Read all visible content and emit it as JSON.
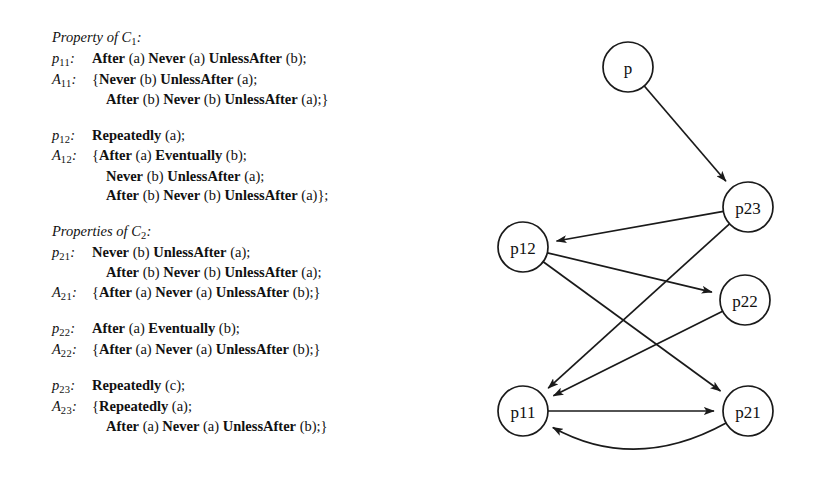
{
  "spec": {
    "blocks": [
      {
        "heading": {
          "text": "Property of C",
          "sub": "1",
          "suffix": ":"
        },
        "lines": [
          {
            "label": "p",
            "label_sub": "11",
            "label_suffix": ":",
            "indented": false,
            "segments": [
              {
                "t": "After",
                "b": true
              },
              {
                "t": " (a) ",
                "b": false
              },
              {
                "t": "Never",
                "b": true
              },
              {
                "t": " (a) ",
                "b": false
              },
              {
                "t": "UnlessAfter",
                "b": true
              },
              {
                "t": " (b);",
                "b": false
              }
            ]
          },
          {
            "label": "A",
            "label_sub": "11",
            "label_suffix": ":",
            "indented": false,
            "segments": [
              {
                "t": "{",
                "b": false
              },
              {
                "t": "Never",
                "b": true
              },
              {
                "t": " (b) ",
                "b": false
              },
              {
                "t": "UnlessAfter",
                "b": true
              },
              {
                "t": " (a);",
                "b": false
              }
            ]
          },
          {
            "label": "",
            "label_sub": "",
            "label_suffix": "",
            "indented": true,
            "segments": [
              {
                "t": "After",
                "b": true
              },
              {
                "t": " (b) ",
                "b": false
              },
              {
                "t": "Never",
                "b": true
              },
              {
                "t": " (b) ",
                "b": false
              },
              {
                "t": "UnlessAfter",
                "b": true
              },
              {
                "t": " (a);}",
                "b": false
              }
            ]
          }
        ]
      },
      {
        "heading": null,
        "lines": [
          {
            "label": "p",
            "label_sub": "12",
            "label_suffix": ":",
            "indented": false,
            "segments": [
              {
                "t": "Repeatedly",
                "b": true
              },
              {
                "t": " (a);",
                "b": false
              }
            ]
          },
          {
            "label": "A",
            "label_sub": "12",
            "label_suffix": ":",
            "indented": false,
            "segments": [
              {
                "t": "{",
                "b": false
              },
              {
                "t": "After",
                "b": true
              },
              {
                "t": " (a) ",
                "b": false
              },
              {
                "t": "Eventually",
                "b": true
              },
              {
                "t": " (b);",
                "b": false
              }
            ]
          },
          {
            "label": "",
            "label_sub": "",
            "label_suffix": "",
            "indented": true,
            "segments": [
              {
                "t": "Never",
                "b": true
              },
              {
                "t": " (b) ",
                "b": false
              },
              {
                "t": "UnlessAfter",
                "b": true
              },
              {
                "t": " (a);",
                "b": false
              }
            ]
          },
          {
            "label": "",
            "label_sub": "",
            "label_suffix": "",
            "indented": true,
            "segments": [
              {
                "t": "After",
                "b": true
              },
              {
                "t": " (b) ",
                "b": false
              },
              {
                "t": "Never",
                "b": true
              },
              {
                "t": " (b) ",
                "b": false
              },
              {
                "t": "UnlessAfter",
                "b": true
              },
              {
                "t": " (a)};",
                "b": false
              }
            ]
          }
        ]
      },
      {
        "heading": {
          "text": "Properties of C",
          "sub": "2",
          "suffix": ":"
        },
        "lines": [
          {
            "label": "p",
            "label_sub": "21",
            "label_suffix": ":",
            "indented": false,
            "segments": [
              {
                "t": "Never",
                "b": true
              },
              {
                "t": " (b) ",
                "b": false
              },
              {
                "t": "UnlessAfter",
                "b": true
              },
              {
                "t": " (a);",
                "b": false
              }
            ]
          },
          {
            "label": "",
            "label_sub": "",
            "label_suffix": "",
            "indented": true,
            "segments": [
              {
                "t": "After",
                "b": true
              },
              {
                "t": " (b) ",
                "b": false
              },
              {
                "t": "Never",
                "b": true
              },
              {
                "t": " (b) ",
                "b": false
              },
              {
                "t": "UnlessAfter",
                "b": true
              },
              {
                "t": " (a);",
                "b": false
              }
            ]
          },
          {
            "label": "A",
            "label_sub": "21",
            "label_suffix": ":",
            "indented": false,
            "segments": [
              {
                "t": "{",
                "b": false
              },
              {
                "t": "After",
                "b": true
              },
              {
                "t": " (a) ",
                "b": false
              },
              {
                "t": "Never",
                "b": true
              },
              {
                "t": " (a) ",
                "b": false
              },
              {
                "t": "UnlessAfter",
                "b": true
              },
              {
                "t": " (b);}",
                "b": false
              }
            ]
          }
        ]
      },
      {
        "heading": null,
        "lines": [
          {
            "label": "p",
            "label_sub": "22",
            "label_suffix": ":",
            "indented": false,
            "segments": [
              {
                "t": "After",
                "b": true
              },
              {
                "t": " (a) ",
                "b": false
              },
              {
                "t": "Eventually",
                "b": true
              },
              {
                "t": " (b);",
                "b": false
              }
            ]
          },
          {
            "label": "A",
            "label_sub": "22",
            "label_suffix": ":",
            "indented": false,
            "segments": [
              {
                "t": "{",
                "b": false
              },
              {
                "t": "After",
                "b": true
              },
              {
                "t": " (a) ",
                "b": false
              },
              {
                "t": "Never",
                "b": true
              },
              {
                "t": " (a) ",
                "b": false
              },
              {
                "t": "UnlessAfter",
                "b": true
              },
              {
                "t": " (b);}",
                "b": false
              }
            ]
          }
        ]
      },
      {
        "heading": null,
        "lines": [
          {
            "label": "p",
            "label_sub": "23",
            "label_suffix": ":",
            "indented": false,
            "segments": [
              {
                "t": "Repeatedly",
                "b": true
              },
              {
                "t": " (c);",
                "b": false
              }
            ]
          },
          {
            "label": "A",
            "label_sub": "23",
            "label_suffix": ":",
            "indented": false,
            "segments": [
              {
                "t": "{",
                "b": false
              },
              {
                "t": "Repeatedly",
                "b": true
              },
              {
                "t": " (a);",
                "b": false
              }
            ]
          },
          {
            "label": "",
            "label_sub": "",
            "label_suffix": "",
            "indented": true,
            "segments": [
              {
                "t": "After",
                "b": true
              },
              {
                "t": " (a) ",
                "b": false
              },
              {
                "t": "Never",
                "b": true
              },
              {
                "t": " (a) ",
                "b": false
              },
              {
                "t": "UnlessAfter",
                "b": true
              },
              {
                "t": " (b);}",
                "b": false
              }
            ]
          }
        ]
      }
    ]
  },
  "graph": {
    "stroke_color": "#1a1a1a",
    "node_fill": "#ffffff",
    "node_radius": 25,
    "nodes": [
      {
        "id": "p",
        "label": "p",
        "x": 173,
        "y": 67
      },
      {
        "id": "p23",
        "label": "p23",
        "x": 293,
        "y": 207
      },
      {
        "id": "p12",
        "label": "p12",
        "x": 68,
        "y": 247
      },
      {
        "id": "p22",
        "label": "p22",
        "x": 290,
        "y": 300
      },
      {
        "id": "p11",
        "label": "p11",
        "x": 68,
        "y": 411
      },
      {
        "id": "p21",
        "label": "p21",
        "x": 293,
        "y": 411
      }
    ],
    "edges": [
      {
        "from": "p",
        "to": "p23",
        "curved": false
      },
      {
        "from": "p23",
        "to": "p12",
        "curved": false
      },
      {
        "from": "p23",
        "to": "p11",
        "curved": false
      },
      {
        "from": "p12",
        "to": "p22",
        "curved": false
      },
      {
        "from": "p12",
        "to": "p21",
        "curved": false
      },
      {
        "from": "p22",
        "to": "p11",
        "curved": false
      },
      {
        "from": "p11",
        "to": "p21",
        "curved": false
      },
      {
        "from": "p21",
        "to": "p11",
        "curved": true
      }
    ]
  }
}
